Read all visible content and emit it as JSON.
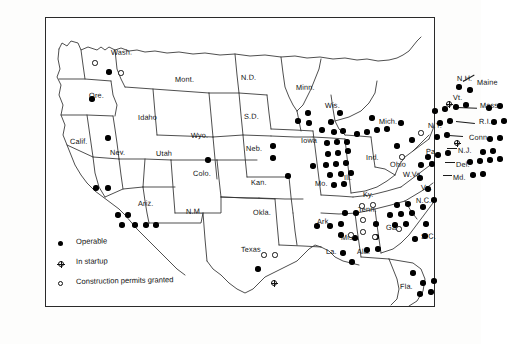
{
  "map": {
    "title": "United States nuclear power plant status map",
    "frame_color": "#2a2a2a",
    "background": "#ffffff"
  },
  "legend": {
    "items": [
      {
        "symbol": "filled-circle",
        "label": "Operable"
      },
      {
        "symbol": "crossed-circle",
        "label": "In startup"
      },
      {
        "symbol": "open-circle",
        "label": "Construction permits granted"
      }
    ]
  },
  "state_labels": [
    {
      "name": "Wash.",
      "x": 66,
      "y": 31
    },
    {
      "name": "Ore.",
      "x": 44,
      "y": 74
    },
    {
      "name": "Idaho",
      "x": 93,
      "y": 96
    },
    {
      "name": "Mont.",
      "x": 130,
      "y": 58
    },
    {
      "name": "Wyo.",
      "x": 146,
      "y": 114
    },
    {
      "name": "N.D.",
      "x": 196,
      "y": 56
    },
    {
      "name": "S.D.",
      "x": 199,
      "y": 95
    },
    {
      "name": "Neb.",
      "x": 201,
      "y": 127
    },
    {
      "name": "Calif.",
      "x": 25,
      "y": 120
    },
    {
      "name": "Nev.",
      "x": 65,
      "y": 131
    },
    {
      "name": "Utah",
      "x": 111,
      "y": 132
    },
    {
      "name": "Colo.",
      "x": 148,
      "y": 152
    },
    {
      "name": "Kan.",
      "x": 206,
      "y": 161
    },
    {
      "name": "Ariz.",
      "x": 93,
      "y": 182
    },
    {
      "name": "N.M.",
      "x": 141,
      "y": 190
    },
    {
      "name": "Okla.",
      "x": 208,
      "y": 191
    },
    {
      "name": "Texas",
      "x": 196,
      "y": 228
    },
    {
      "name": "Minn.",
      "x": 251,
      "y": 66
    },
    {
      "name": "Iowa",
      "x": 256,
      "y": 119
    },
    {
      "name": "Mo.",
      "x": 270,
      "y": 162
    },
    {
      "name": "Ark.",
      "x": 272,
      "y": 200
    },
    {
      "name": "La.",
      "x": 281,
      "y": 230
    },
    {
      "name": "Miss.",
      "x": 296,
      "y": 216
    },
    {
      "name": "Ala.",
      "x": 312,
      "y": 230
    },
    {
      "name": "Wis.",
      "x": 280,
      "y": 84
    },
    {
      "name": "Ill.",
      "x": 299,
      "y": 156
    },
    {
      "name": "Ind.",
      "x": 321,
      "y": 136
    },
    {
      "name": "Mich.",
      "x": 334,
      "y": 100
    },
    {
      "name": "Ohio",
      "x": 345,
      "y": 143
    },
    {
      "name": "Ky.",
      "x": 318,
      "y": 173
    },
    {
      "name": "Tenn.",
      "x": 313,
      "y": 188
    },
    {
      "name": "W.Va.",
      "x": 358,
      "y": 153
    },
    {
      "name": "Va.",
      "x": 376,
      "y": 166
    },
    {
      "name": "N.C.",
      "x": 371,
      "y": 179
    },
    {
      "name": "S.C.",
      "x": 376,
      "y": 215
    },
    {
      "name": "Ga.",
      "x": 341,
      "y": 206
    },
    {
      "name": "Fla.",
      "x": 355,
      "y": 265
    },
    {
      "name": "Pa.",
      "x": 381,
      "y": 130
    },
    {
      "name": "N.Y.",
      "x": 383,
      "y": 104
    },
    {
      "name": "Vt.",
      "x": 408,
      "y": 76
    },
    {
      "name": "N.H.",
      "x": 412,
      "y": 57
    },
    {
      "name": "Maine",
      "x": 432,
      "y": 61
    },
    {
      "name": "Mass.",
      "x": 435,
      "y": 84
    },
    {
      "name": "R.I.",
      "x": 434,
      "y": 100
    },
    {
      "name": "Conn.",
      "x": 424,
      "y": 116
    },
    {
      "name": "N.J.",
      "x": 413,
      "y": 129
    },
    {
      "name": "Del.",
      "x": 411,
      "y": 143
    },
    {
      "name": "Md.",
      "x": 408,
      "y": 156
    }
  ],
  "plants": {
    "operable": [
      {
        "x": 64,
        "y": 55
      },
      {
        "x": 47,
        "y": 82
      },
      {
        "x": 63,
        "y": 121
      },
      {
        "x": 51,
        "y": 171
      },
      {
        "x": 63,
        "y": 171
      },
      {
        "x": 73,
        "y": 198
      },
      {
        "x": 83,
        "y": 198
      },
      {
        "x": 77,
        "y": 208
      },
      {
        "x": 90,
        "y": 208
      },
      {
        "x": 101,
        "y": 208
      },
      {
        "x": 111,
        "y": 208
      },
      {
        "x": 163,
        "y": 143
      },
      {
        "x": 228,
        "y": 129
      },
      {
        "x": 228,
        "y": 141
      },
      {
        "x": 243,
        "y": 159
      },
      {
        "x": 268,
        "y": 149
      },
      {
        "x": 263,
        "y": 96
      },
      {
        "x": 253,
        "y": 104
      },
      {
        "x": 264,
        "y": 106
      },
      {
        "x": 277,
        "y": 113
      },
      {
        "x": 286,
        "y": 105
      },
      {
        "x": 295,
        "y": 96
      },
      {
        "x": 289,
        "y": 115
      },
      {
        "x": 298,
        "y": 114
      },
      {
        "x": 282,
        "y": 126
      },
      {
        "x": 292,
        "y": 125
      },
      {
        "x": 302,
        "y": 125
      },
      {
        "x": 283,
        "y": 137
      },
      {
        "x": 293,
        "y": 136
      },
      {
        "x": 303,
        "y": 134
      },
      {
        "x": 281,
        "y": 148
      },
      {
        "x": 291,
        "y": 147
      },
      {
        "x": 301,
        "y": 146
      },
      {
        "x": 285,
        "y": 158
      },
      {
        "x": 296,
        "y": 157
      },
      {
        "x": 306,
        "y": 156
      },
      {
        "x": 289,
        "y": 168
      },
      {
        "x": 299,
        "y": 167
      },
      {
        "x": 312,
        "y": 117
      },
      {
        "x": 322,
        "y": 115
      },
      {
        "x": 332,
        "y": 113
      },
      {
        "x": 327,
        "y": 101
      },
      {
        "x": 342,
        "y": 112
      },
      {
        "x": 352,
        "y": 129
      },
      {
        "x": 367,
        "y": 123
      },
      {
        "x": 356,
        "y": 106
      },
      {
        "x": 272,
        "y": 209
      },
      {
        "x": 285,
        "y": 209
      },
      {
        "x": 298,
        "y": 236
      },
      {
        "x": 307,
        "y": 245
      },
      {
        "x": 310,
        "y": 221
      },
      {
        "x": 300,
        "y": 196
      },
      {
        "x": 311,
        "y": 196
      },
      {
        "x": 296,
        "y": 207
      },
      {
        "x": 296,
        "y": 218
      },
      {
        "x": 322,
        "y": 233
      },
      {
        "x": 333,
        "y": 232
      },
      {
        "x": 331,
        "y": 207
      },
      {
        "x": 331,
        "y": 220
      },
      {
        "x": 352,
        "y": 188
      },
      {
        "x": 363,
        "y": 187
      },
      {
        "x": 345,
        "y": 198
      },
      {
        "x": 356,
        "y": 197
      },
      {
        "x": 367,
        "y": 196
      },
      {
        "x": 350,
        "y": 208
      },
      {
        "x": 361,
        "y": 207
      },
      {
        "x": 378,
        "y": 190
      },
      {
        "x": 389,
        "y": 183
      },
      {
        "x": 383,
        "y": 172
      },
      {
        "x": 375,
        "y": 161
      },
      {
        "x": 381,
        "y": 207
      },
      {
        "x": 370,
        "y": 222
      },
      {
        "x": 380,
        "y": 219
      },
      {
        "x": 368,
        "y": 256
      },
      {
        "x": 378,
        "y": 266
      },
      {
        "x": 389,
        "y": 264
      },
      {
        "x": 375,
        "y": 277
      },
      {
        "x": 386,
        "y": 275
      },
      {
        "x": 383,
        "y": 140
      },
      {
        "x": 393,
        "y": 138
      },
      {
        "x": 403,
        "y": 136
      },
      {
        "x": 376,
        "y": 148
      },
      {
        "x": 387,
        "y": 147
      },
      {
        "x": 392,
        "y": 120
      },
      {
        "x": 402,
        "y": 118
      },
      {
        "x": 395,
        "y": 106
      },
      {
        "x": 405,
        "y": 104
      },
      {
        "x": 390,
        "y": 94
      },
      {
        "x": 400,
        "y": 92
      },
      {
        "x": 411,
        "y": 90
      },
      {
        "x": 421,
        "y": 88
      },
      {
        "x": 425,
        "y": 73
      },
      {
        "x": 414,
        "y": 70
      },
      {
        "x": 444,
        "y": 91
      },
      {
        "x": 455,
        "y": 89
      },
      {
        "x": 449,
        "y": 105
      },
      {
        "x": 459,
        "y": 104
      },
      {
        "x": 445,
        "y": 122
      },
      {
        "x": 455,
        "y": 121
      },
      {
        "x": 438,
        "y": 135
      },
      {
        "x": 448,
        "y": 134
      },
      {
        "x": 425,
        "y": 145
      },
      {
        "x": 435,
        "y": 144
      },
      {
        "x": 445,
        "y": 143
      },
      {
        "x": 455,
        "y": 142
      },
      {
        "x": 428,
        "y": 158
      },
      {
        "x": 438,
        "y": 157
      },
      {
        "x": 213,
        "y": 252
      }
    ],
    "construction": [
      {
        "x": 50,
        "y": 46
      },
      {
        "x": 76,
        "y": 56
      },
      {
        "x": 317,
        "y": 189
      },
      {
        "x": 328,
        "y": 188
      },
      {
        "x": 318,
        "y": 203
      },
      {
        "x": 318,
        "y": 215
      },
      {
        "x": 330,
        "y": 220
      },
      {
        "x": 354,
        "y": 212
      },
      {
        "x": 306,
        "y": 218
      },
      {
        "x": 357,
        "y": 140
      },
      {
        "x": 219,
        "y": 238
      },
      {
        "x": 230,
        "y": 238
      },
      {
        "x": 376,
        "y": 116
      }
    ],
    "startup": [
      {
        "x": 229,
        "y": 266
      },
      {
        "x": 404,
        "y": 87
      },
      {
        "x": 412,
        "y": 126
      }
    ]
  },
  "leaders": [
    {
      "x": 418,
      "y": 64,
      "len": 13,
      "angle": -30
    },
    {
      "x": 412,
      "y": 90,
      "len": 20,
      "angle": 2
    },
    {
      "x": 411,
      "y": 104,
      "len": 19,
      "angle": 6
    },
    {
      "x": 404,
      "y": 118,
      "len": 14,
      "angle": 4
    },
    {
      "x": 402,
      "y": 131,
      "len": 10,
      "angle": 0
    },
    {
      "x": 400,
      "y": 145,
      "len": 10,
      "angle": 0
    },
    {
      "x": 398,
      "y": 158,
      "len": 9,
      "angle": 0
    }
  ]
}
